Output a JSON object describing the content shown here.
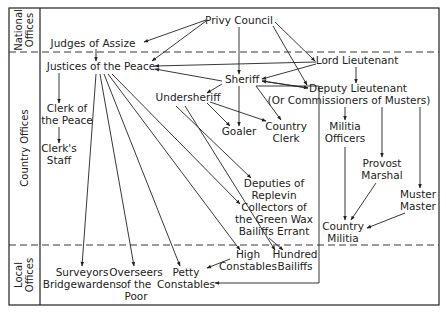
{
  "diagram": {
    "type": "organizational-hierarchy",
    "sections": [
      {
        "id": "national",
        "label_lines": [
          "National",
          "Offices"
        ]
      },
      {
        "id": "country",
        "label_lines": [
          "Country Offices"
        ]
      },
      {
        "id": "local",
        "label_lines": [
          "Local",
          "Offices"
        ]
      }
    ],
    "nodes": {
      "privy_council": [
        "Privy Council"
      ],
      "judges_of_assize": [
        "Judges of Assize"
      ],
      "justices_of_the_peace": [
        "Justices of the Peace"
      ],
      "lord_lieutenant": [
        "Lord Lieutenant"
      ],
      "sheriff": [
        "Sheriff"
      ],
      "deputy_lieutenant": [
        "Deputy Lieutenant",
        "(Or Commissioners of Musters)"
      ],
      "undersheriff": [
        "Undersheriff"
      ],
      "clerk_of_the_peace": [
        "Clerk of",
        "the Peace"
      ],
      "clerks_staff": [
        "Clerk's",
        "Staff"
      ],
      "goaler": [
        "Goaler"
      ],
      "country_clerk": [
        "Country",
        "Clerk"
      ],
      "militia_officers": [
        "Militia",
        "Officers"
      ],
      "provost_marshal": [
        "Provost",
        "Marshal"
      ],
      "muster_master": [
        "Muster",
        "Master"
      ],
      "country_militia": [
        "Country",
        "Militia"
      ],
      "deputies_of_replevin": [
        "Deputies of",
        "Replevin"
      ],
      "collectors_green_wax": [
        "Collectors of",
        "the Green Wax"
      ],
      "bailiffs_errant": [
        "Bailiffs Errant"
      ],
      "high_constables": [
        "High",
        "Constables"
      ],
      "hundred_bailiffs": [
        "Hundred",
        "Bailiffs"
      ],
      "surveyors": [
        "Surveyors",
        "Bridgewardens"
      ],
      "overseers": [
        "Overseers",
        "of the",
        "Poor"
      ],
      "petty_constables": [
        "Petty",
        "Constables"
      ]
    },
    "edges": [
      [
        "Privy Council",
        "Judges of Assize"
      ],
      [
        "Privy Council",
        "Justices of the Peace"
      ],
      [
        "Privy Council",
        "Sheriff"
      ],
      [
        "Privy Council",
        "Lord Lieutenant"
      ],
      [
        "Privy Council",
        "Deputy Lieutenant"
      ],
      [
        "Judges of Assize",
        "Justices of the Peace"
      ],
      [
        "Lord Lieutenant",
        "Justices of the Peace"
      ],
      [
        "Lord Lieutenant",
        "Sheriff"
      ],
      [
        "Lord Lieutenant",
        "Deputy Lieutenant"
      ],
      [
        "Sheriff",
        "Justices of the Peace"
      ],
      [
        "Sheriff",
        "Deputy Lieutenant"
      ],
      [
        "Deputy Lieutenant",
        "Sheriff"
      ],
      [
        "Sheriff",
        "Undersheriff"
      ],
      [
        "Sheriff",
        "Goaler"
      ],
      [
        "Sheriff",
        "Country Clerk"
      ],
      [
        "Sheriff",
        "Petty Constables"
      ],
      [
        "Undersheriff",
        "Goaler"
      ],
      [
        "Undersheriff",
        "Country Clerk"
      ],
      [
        "Undersheriff",
        "Deputies of Replevin"
      ],
      [
        "Undersheriff",
        "Hundred Bailiffs"
      ],
      [
        "Undersheriff",
        "Hundred Bailiffs"
      ],
      [
        "Justices of the Peace",
        "Clerk of the Peace"
      ],
      [
        "Clerk of the Peace",
        "Clerk's Staff"
      ],
      [
        "Justices of the Peace",
        "Surveyors Bridgewardens"
      ],
      [
        "Justices of the Peace",
        "Overseers of the Poor"
      ],
      [
        "Justices of the Peace",
        "Petty Constables"
      ],
      [
        "Justices of the Peace",
        "High Constables"
      ],
      [
        "Justices of the Peace",
        "Collectors of the Green Wax"
      ],
      [
        "High Constables",
        "Petty Constables"
      ],
      [
        "Deputy Lieutenant",
        "Militia Officers"
      ],
      [
        "Deputy Lieutenant",
        "Provost Marshal"
      ],
      [
        "Deputy Lieutenant",
        "Muster Master"
      ],
      [
        "Militia Officers",
        "Country Militia"
      ],
      [
        "Provost Marshal",
        "Country Militia"
      ],
      [
        "Muster Master",
        "Country Militia"
      ]
    ]
  }
}
